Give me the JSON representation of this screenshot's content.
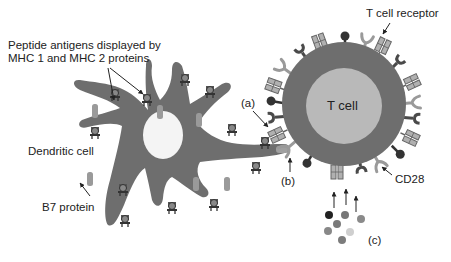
{
  "diagram": {
    "type": "biology-illustration",
    "colors": {
      "background": "#ffffff",
      "cell_body": "#6e6e6e",
      "dendritic_nucleus": "#f4f4f4",
      "tcell_nucleus": "#b9b9b9",
      "receptor_light": "#a8a8a8",
      "receptor_dark": "#4a4a4a",
      "text": "#222222"
    },
    "labels": {
      "peptide_antigens_line1": "Peptide antigens displayed by",
      "peptide_antigens_line2": "MHC 1 and MHC 2 proteins",
      "dendritic_cell": "Dendritic cell",
      "b7_protein": "B7 protein",
      "t_cell": "T cell",
      "t_cell_receptor": "T cell receptor",
      "cd28": "CD28",
      "a": "(a)",
      "b": "(b)",
      "c": "(c)"
    },
    "cells": [
      {
        "name": "Dendritic cell",
        "shape": "star-shaped with dendrites",
        "nucleus": "white round"
      },
      {
        "name": "T cell",
        "shape": "circle",
        "nucleus": "light gray round"
      }
    ],
    "signal_molecules": {
      "count": 7,
      "colors": [
        "#222222",
        "#777777",
        "#8a8a8a",
        "#7a7a7a",
        "#888888",
        "#cfcfcf",
        "#7c7c7c"
      ]
    }
  }
}
